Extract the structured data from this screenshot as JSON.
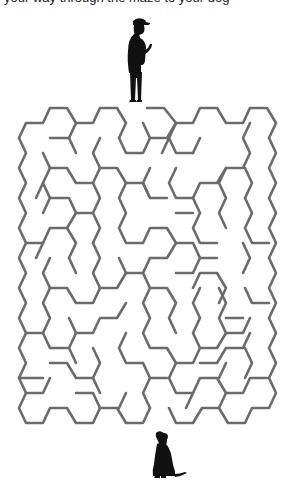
{
  "caption": "your way through the maze to your dog",
  "colors": {
    "background": "#ffffff",
    "wall": "#6b6b6b",
    "silhouette": "#111111"
  },
  "maze": {
    "stroke_width": 2.6,
    "walls": [
      [
        [
          19,
          138
        ],
        [
          26,
          123
        ],
        [
          43,
          123
        ],
        [
          50,
          108
        ],
        [
          67,
          108
        ],
        [
          76,
          123
        ],
        [
          93,
          123
        ],
        [
          100,
          108
        ],
        [
          117,
          108
        ],
        [
          126,
          123
        ],
        [
          119,
          138
        ]
      ],
      [
        [
          50,
          138
        ],
        [
          69,
          138
        ],
        [
          76,
          153
        ]
      ],
      [
        [
          69,
          138
        ],
        [
          76,
          123
        ]
      ],
      [
        [
          100,
          138
        ],
        [
          93,
          153
        ],
        [
          100,
          168
        ],
        [
          117,
          168
        ],
        [
          126,
          183
        ]
      ],
      [
        [
          43,
          153
        ],
        [
          50,
          168
        ],
        [
          67,
          168
        ],
        [
          76,
          183
        ],
        [
          93,
          183
        ],
        [
          100,
          168
        ]
      ],
      [
        [
          50,
          168
        ],
        [
          43,
          183
        ],
        [
          50,
          198
        ],
        [
          67,
          198
        ]
      ],
      [
        [
          43,
          183
        ],
        [
          36,
          198
        ]
      ],
      [
        [
          93,
          183
        ],
        [
          100,
          198
        ],
        [
          93,
          213
        ],
        [
          100,
          228
        ],
        [
          93,
          243
        ]
      ],
      [
        [
          19,
          138
        ],
        [
          26,
          153
        ],
        [
          19,
          168
        ],
        [
          26,
          183
        ],
        [
          19,
          198
        ],
        [
          26,
          213
        ],
        [
          19,
          228
        ],
        [
          26,
          243
        ],
        [
          19,
          258
        ],
        [
          26,
          273
        ],
        [
          19,
          288
        ],
        [
          26,
          303
        ],
        [
          19,
          318
        ],
        [
          26,
          333
        ],
        [
          19,
          348
        ],
        [
          26,
          363
        ],
        [
          19,
          378
        ],
        [
          26,
          393
        ],
        [
          19,
          408
        ],
        [
          26,
          423
        ],
        [
          43,
          423
        ],
        [
          50,
          408
        ],
        [
          67,
          408
        ],
        [
          76,
          423
        ],
        [
          93,
          423
        ],
        [
          100,
          408
        ],
        [
          117,
          408
        ],
        [
          126,
          423
        ],
        [
          143,
          423
        ],
        [
          150,
          408
        ]
      ],
      [
        [
          26,
          243
        ],
        [
          43,
          243
        ],
        [
          50,
          228
        ],
        [
          67,
          228
        ],
        [
          76,
          213
        ],
        [
          93,
          213
        ]
      ],
      [
        [
          76,
          213
        ],
        [
          69,
          198
        ]
      ],
      [
        [
          43,
          213
        ],
        [
          50,
          198
        ]
      ],
      [
        [
          67,
          228
        ],
        [
          76,
          243
        ],
        [
          69,
          258
        ],
        [
          76,
          273
        ]
      ],
      [
        [
          36,
          258
        ],
        [
          43,
          243
        ]
      ],
      [
        [
          50,
          258
        ],
        [
          43,
          273
        ],
        [
          50,
          288
        ],
        [
          67,
          288
        ],
        [
          76,
          303
        ],
        [
          93,
          303
        ],
        [
          100,
          288
        ],
        [
          117,
          288
        ],
        [
          126,
          273
        ],
        [
          143,
          273
        ],
        [
          150,
          258
        ]
      ],
      [
        [
          100,
          288
        ],
        [
          93,
          273
        ],
        [
          100,
          258
        ],
        [
          93,
          243
        ]
      ],
      [
        [
          50,
          288
        ],
        [
          43,
          303
        ],
        [
          50,
          318
        ],
        [
          43,
          333
        ],
        [
          50,
          348
        ]
      ],
      [
        [
          26,
          333
        ],
        [
          43,
          333
        ]
      ],
      [
        [
          69,
          318
        ],
        [
          76,
          333
        ],
        [
          93,
          333
        ],
        [
          100,
          318
        ],
        [
          117,
          318
        ],
        [
          126,
          303
        ]
      ],
      [
        [
          76,
          333
        ],
        [
          69,
          348
        ],
        [
          76,
          363
        ]
      ],
      [
        [
          50,
          348
        ],
        [
          67,
          348
        ]
      ],
      [
        [
          93,
          348
        ],
        [
          100,
          363
        ],
        [
          93,
          378
        ],
        [
          100,
          393
        ]
      ],
      [
        [
          50,
          363
        ],
        [
          67,
          363
        ],
        [
          76,
          378
        ],
        [
          93,
          378
        ]
      ],
      [
        [
          19,
          378
        ],
        [
          43,
          378
        ]
      ],
      [
        [
          26,
          393
        ],
        [
          43,
          393
        ],
        [
          50,
          378
        ]
      ],
      [
        [
          76,
          393
        ],
        [
          93,
          393
        ],
        [
          100,
          408
        ]
      ],
      [
        [
          119,
          138
        ],
        [
          126,
          153
        ],
        [
          143,
          153
        ],
        [
          150,
          138
        ],
        [
          167,
          138
        ],
        [
          176,
          123
        ]
      ],
      [
        [
          126,
          183
        ],
        [
          119,
          198
        ],
        [
          126,
          213
        ],
        [
          119,
          228
        ],
        [
          126,
          243
        ],
        [
          143,
          243
        ],
        [
          150,
          228
        ],
        [
          167,
          228
        ],
        [
          176,
          243
        ]
      ],
      [
        [
          126,
          183
        ],
        [
          143,
          183
        ],
        [
          150,
          198
        ],
        [
          167,
          198
        ]
      ],
      [
        [
          119,
          258
        ],
        [
          126,
          273
        ]
      ],
      [
        [
          143,
          273
        ],
        [
          150,
          288
        ],
        [
          143,
          303
        ],
        [
          150,
          318
        ],
        [
          143,
          333
        ],
        [
          150,
          348
        ],
        [
          167,
          348
        ],
        [
          176,
          363
        ],
        [
          169,
          378
        ]
      ],
      [
        [
          126,
          333
        ],
        [
          119,
          348
        ],
        [
          126,
          363
        ],
        [
          143,
          363
        ],
        [
          150,
          378
        ],
        [
          167,
          378
        ]
      ],
      [
        [
          150,
          378
        ],
        [
          143,
          393
        ],
        [
          150,
          408
        ]
      ],
      [
        [
          126,
          393
        ],
        [
          119,
          408
        ]
      ],
      [
        [
          147,
          108
        ],
        [
          164,
          108
        ],
        [
          176,
          123
        ],
        [
          193,
          123
        ],
        [
          200,
          108
        ],
        [
          217,
          108
        ],
        [
          226,
          123
        ],
        [
          243,
          123
        ],
        [
          250,
          108
        ],
        [
          267,
          108
        ],
        [
          276,
          123
        ],
        [
          269,
          138
        ],
        [
          276,
          153
        ],
        [
          269,
          168
        ],
        [
          276,
          183
        ],
        [
          269,
          198
        ],
        [
          276,
          213
        ],
        [
          269,
          228
        ],
        [
          276,
          243
        ],
        [
          269,
          258
        ],
        [
          276,
          273
        ],
        [
          269,
          288
        ],
        [
          276,
          303
        ],
        [
          269,
          318
        ],
        [
          276,
          333
        ],
        [
          269,
          348
        ],
        [
          276,
          363
        ],
        [
          269,
          378
        ],
        [
          276,
          393
        ],
        [
          269,
          408
        ],
        [
          252,
          408
        ],
        [
          245,
          423
        ],
        [
          228,
          423
        ],
        [
          219,
          408
        ],
        [
          202,
          408
        ],
        [
          193,
          423
        ],
        [
          176,
          423
        ],
        [
          169,
          408
        ]
      ],
      [
        [
          143,
          123
        ],
        [
          150,
          138
        ]
      ],
      [
        [
          176,
          123
        ],
        [
          169,
          138
        ],
        [
          176,
          153
        ],
        [
          193,
          153
        ]
      ],
      [
        [
          169,
          138
        ],
        [
          162,
          153
        ]
      ],
      [
        [
          193,
          153
        ],
        [
          200,
          138
        ]
      ],
      [
        [
          150,
          168
        ],
        [
          143,
          183
        ],
        [
          150,
          198
        ]
      ],
      [
        [
          176,
          168
        ],
        [
          169,
          183
        ],
        [
          176,
          198
        ],
        [
          193,
          198
        ],
        [
          200,
          183
        ],
        [
          217,
          183
        ],
        [
          226,
          168
        ],
        [
          243,
          168
        ],
        [
          250,
          153
        ],
        [
          243,
          138
        ],
        [
          250,
          123
        ]
      ],
      [
        [
          226,
          168
        ],
        [
          219,
          183
        ],
        [
          226,
          198
        ],
        [
          219,
          213
        ],
        [
          226,
          228
        ]
      ],
      [
        [
          245,
          168
        ],
        [
          252,
          183
        ],
        [
          245,
          198
        ],
        [
          252,
          213
        ],
        [
          245,
          228
        ],
        [
          252,
          243
        ],
        [
          269,
          243
        ]
      ],
      [
        [
          193,
          198
        ],
        [
          200,
          213
        ],
        [
          193,
          228
        ],
        [
          200,
          243
        ],
        [
          217,
          243
        ]
      ],
      [
        [
          176,
          213
        ],
        [
          193,
          213
        ]
      ],
      [
        [
          150,
          258
        ],
        [
          167,
          258
        ],
        [
          176,
          243
        ],
        [
          193,
          243
        ],
        [
          200,
          258
        ],
        [
          217,
          258
        ]
      ],
      [
        [
          176,
          273
        ],
        [
          193,
          273
        ],
        [
          200,
          258
        ]
      ],
      [
        [
          150,
          288
        ],
        [
          167,
          288
        ],
        [
          176,
          303
        ],
        [
          169,
          318
        ],
        [
          176,
          333
        ]
      ],
      [
        [
          193,
          288
        ],
        [
          200,
          273
        ],
        [
          217,
          273
        ],
        [
          226,
          288
        ],
        [
          219,
          303
        ]
      ],
      [
        [
          200,
          288
        ],
        [
          193,
          303
        ],
        [
          200,
          318
        ],
        [
          193,
          333
        ],
        [
          200,
          348
        ],
        [
          217,
          348
        ],
        [
          226,
          333
        ],
        [
          219,
          318
        ],
        [
          226,
          303
        ],
        [
          219,
          288
        ]
      ],
      [
        [
          226,
          318
        ],
        [
          243,
          318
        ]
      ],
      [
        [
          226,
          333
        ],
        [
          243,
          333
        ],
        [
          250,
          318
        ]
      ],
      [
        [
          245,
          288
        ],
        [
          252,
          303
        ],
        [
          269,
          303
        ]
      ],
      [
        [
          243,
          273
        ],
        [
          250,
          258
        ],
        [
          243,
          243
        ]
      ],
      [
        [
          176,
          363
        ],
        [
          193,
          363
        ],
        [
          200,
          348
        ]
      ],
      [
        [
          200,
          363
        ],
        [
          217,
          363
        ],
        [
          226,
          348
        ],
        [
          243,
          348
        ],
        [
          250,
          333
        ]
      ],
      [
        [
          169,
          378
        ],
        [
          176,
          393
        ],
        [
          193,
          393
        ],
        [
          200,
          378
        ],
        [
          217,
          378
        ],
        [
          226,
          393
        ],
        [
          219,
          408
        ]
      ],
      [
        [
          226,
          393
        ],
        [
          243,
          393
        ],
        [
          250,
          378
        ],
        [
          267,
          378
        ]
      ],
      [
        [
          245,
          378
        ],
        [
          252,
          363
        ],
        [
          245,
          348
        ]
      ],
      [
        [
          219,
          378
        ],
        [
          226,
          363
        ]
      ],
      [
        [
          193,
          393
        ],
        [
          186,
          408
        ]
      ]
    ]
  },
  "figures": {
    "man": {
      "label": "man-silhouette"
    },
    "dog": {
      "label": "dog-silhouette"
    }
  }
}
